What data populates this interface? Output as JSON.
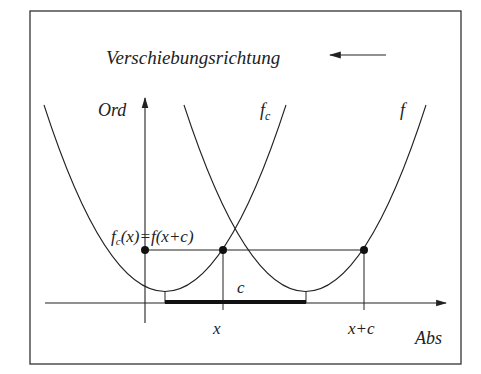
{
  "title": "Verschiebungsrichtung",
  "axes": {
    "y_label": "Ord",
    "x_label": "Abs"
  },
  "curves": [
    {
      "name": "f_c",
      "label_main": "f",
      "label_sub": "c"
    },
    {
      "name": "f",
      "label_main": "f"
    }
  ],
  "equation": {
    "lhs_main": "f",
    "lhs_sub": "c",
    "lhs_rest": "(x)",
    "rhs": "=f(x+c)"
  },
  "ticks": {
    "x": "x",
    "x_plus_c": "x+c"
  },
  "shift_label": "c",
  "colors": {
    "ink": "#222222",
    "background": "#ffffff"
  }
}
